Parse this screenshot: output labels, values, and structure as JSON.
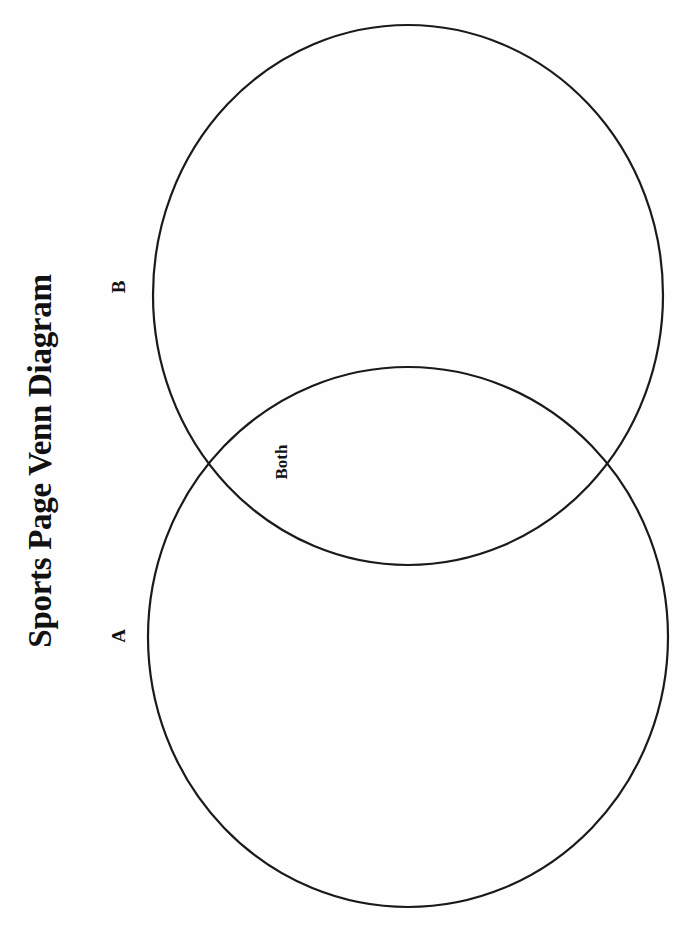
{
  "diagram": {
    "title": "Sports Page Venn Diagram",
    "type": "venn",
    "orientation": "rotated-90-ccw",
    "sets": [
      {
        "id": "A",
        "label": "A"
      },
      {
        "id": "B",
        "label": "B"
      }
    ],
    "intersection": {
      "label": "Both",
      "sets": [
        "A",
        "B"
      ]
    },
    "stroke_color": "#1a1a1a",
    "background_color": "#ffffff"
  }
}
